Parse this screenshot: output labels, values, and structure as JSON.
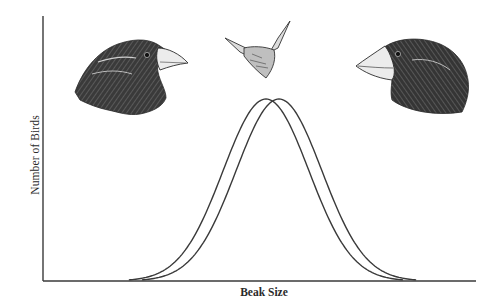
{
  "chart_data": {
    "type": "line",
    "title": "",
    "subtitle": "",
    "xlabel": "Beak Size",
    "ylabel": "Number of Birds",
    "x_ticks": [],
    "y_ticks": [],
    "grid": false,
    "legend": null,
    "xlim": [
      0,
      100
    ],
    "ylim": [
      0,
      100
    ],
    "series": [
      {
        "name": "Distribution before (smaller beaks)",
        "shape": "normal",
        "mean": 51.5,
        "sd": 9.9,
        "peak": 100,
        "x": [
          22,
          30,
          38,
          44,
          51.5,
          59,
          65,
          73,
          81
        ],
        "values": [
          1,
          8,
          39,
          75,
          100,
          75,
          39,
          8,
          1
        ]
      },
      {
        "name": "Distribution after (larger beaks)",
        "shape": "normal",
        "mean": 54.5,
        "sd": 9.9,
        "peak": 100,
        "x": [
          25,
          33,
          41,
          47,
          54.5,
          62,
          68,
          76,
          84
        ],
        "values": [
          1,
          8,
          39,
          75,
          100,
          75,
          39,
          8,
          1
        ]
      }
    ],
    "annotations": [
      {
        "type": "illustration",
        "label": "finch-head-small-beak",
        "position": "upper-left",
        "facing": "right"
      },
      {
        "type": "illustration",
        "label": "spiny-seed",
        "position": "top-center"
      },
      {
        "type": "illustration",
        "label": "finch-head-large-beak",
        "position": "upper-right",
        "facing": "left"
      }
    ]
  },
  "axes": {
    "x_label": "Beak Size",
    "y_label": "Number of Birds"
  },
  "colors": {
    "line": "#3a3a3a",
    "axis": "#3a3a3a",
    "text": "#2a2a2a",
    "bird_dark": "#2e2e2e",
    "beak": "#e8e8e8"
  }
}
